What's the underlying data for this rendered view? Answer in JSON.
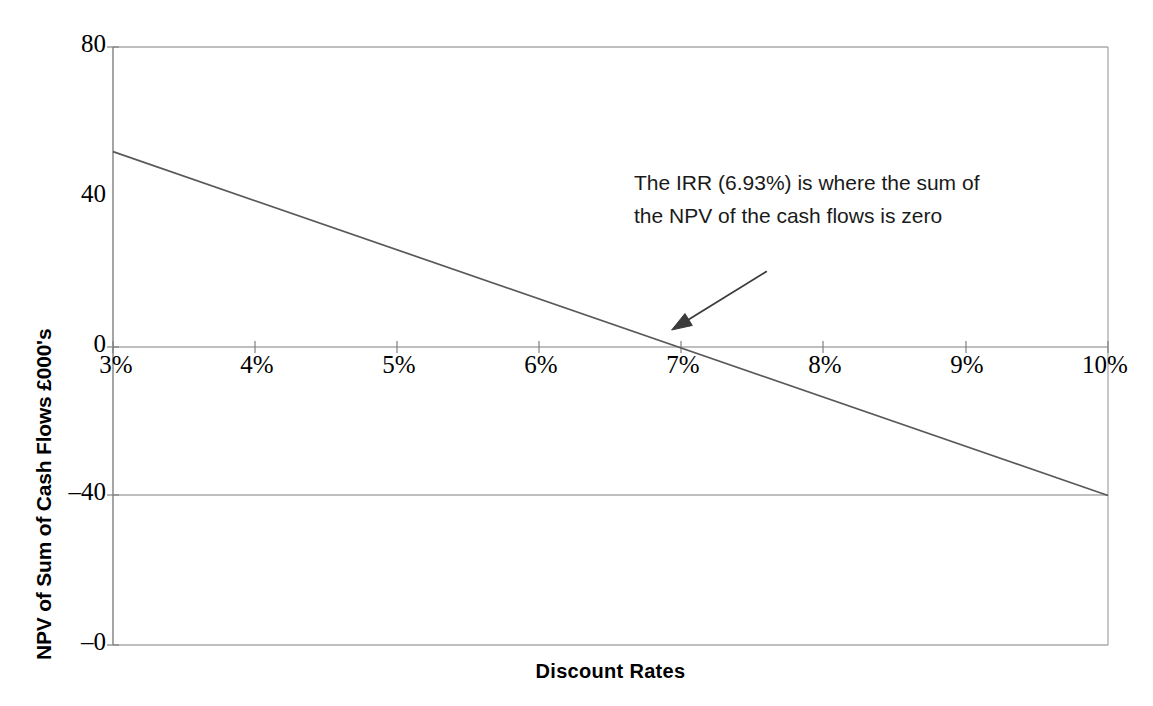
{
  "chart_data": {
    "type": "line",
    "title": "",
    "xlabel": "Discount Rates",
    "ylabel": "NPV of Sum of Cash Flows £000's",
    "x": [
      3,
      10
    ],
    "x_tick_labels": [
      "3%",
      "4%",
      "5%",
      "6%",
      "7%",
      "8%",
      "9%",
      "10%"
    ],
    "x_tick_values": [
      3,
      4,
      5,
      6,
      7,
      8,
      9,
      10
    ],
    "xlim": [
      3,
      10
    ],
    "y_tick_labels": [
      "80",
      "40",
      "0",
      "–40",
      "–0"
    ],
    "y_tick_values": [
      80,
      40,
      0,
      -40,
      -80
    ],
    "ylim": [
      -80,
      80
    ],
    "series": [
      {
        "name": "NPV of Sum of Cash Flows",
        "values": [
          52,
          -40
        ],
        "color": "#595959"
      }
    ],
    "grid": true,
    "gridlines_y": [
      80,
      0,
      -40,
      -80
    ],
    "legend": "none",
    "annotations": [
      {
        "name": "irr-callout",
        "line1": "The IRR (6.93%) is where the sum of",
        "line2": "the NPV of the cash flows is zero",
        "arrow_from_x": 7.6,
        "arrow_from_y": 20,
        "arrow_to_x": 6.93,
        "arrow_to_y": 0
      }
    ],
    "irr": "6.93%",
    "irr_value": 6.93
  },
  "axes": {
    "y_title": "NPV of Sum of Cash Flows £000's",
    "x_title": "Discount Rates",
    "y_ticks": [
      {
        "label": "80",
        "value": 80
      },
      {
        "label": "40",
        "value": 40
      },
      {
        "label": "0",
        "value": 0
      },
      {
        "label": "–40",
        "value": -40
      },
      {
        "label": "–0",
        "value": -80
      }
    ],
    "x_ticks": [
      {
        "label": "3%",
        "value": 3
      },
      {
        "label": "4%",
        "value": 4
      },
      {
        "label": "5%",
        "value": 5
      },
      {
        "label": "6%",
        "value": 6
      },
      {
        "label": "7%",
        "value": 7
      },
      {
        "label": "8%",
        "value": 8
      },
      {
        "label": "9%",
        "value": 9
      },
      {
        "label": "10%",
        "value": 10
      }
    ]
  },
  "annotation": {
    "line1": "The IRR (6.93%) is where the sum of",
    "line2": "the NPV of the cash flows is zero"
  },
  "colors": {
    "line": "#595959",
    "grid": "#7f7f7f",
    "axis": "#7f7f7f",
    "text": "#000000",
    "annotation_text": "#1a1a1a",
    "background": "#ffffff"
  }
}
